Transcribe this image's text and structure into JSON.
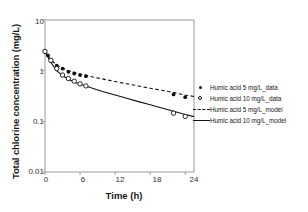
{
  "chart_data": {
    "type": "scatter",
    "title": "",
    "xlabel": "Time (h)",
    "ylabel": "Total chlorine concentration (mg/L)",
    "xlim": [
      0,
      25.5
    ],
    "ylim": [
      0.01,
      10
    ],
    "yscale": "log",
    "xticks": [
      "0",
      "6",
      "12",
      "18",
      "24"
    ],
    "xtick_values": [
      0,
      6,
      12,
      18,
      24
    ],
    "yticks": [
      "10",
      "1",
      "0.1",
      "0.01"
    ],
    "ytick_values": [
      10,
      1,
      0.1,
      0.01
    ],
    "grid": false,
    "legend_position": "right-outside",
    "series": [
      {
        "name": "Humic acid 5 mg/L_data",
        "kind": "scatter",
        "marker": "filled-circle",
        "color": "#111111",
        "x": [
          0,
          0.5,
          1,
          2,
          3,
          4,
          5,
          6,
          7,
          22,
          24
        ],
        "y": [
          2.35,
          2.0,
          1.55,
          1.25,
          1.1,
          0.95,
          0.88,
          0.82,
          0.78,
          0.34,
          0.3
        ]
      },
      {
        "name": "Humic acid 10 mg/L_data",
        "kind": "scatter",
        "marker": "open-circle",
        "color": "#111111",
        "x": [
          0,
          1,
          2,
          3,
          4,
          5,
          6,
          7,
          22,
          24
        ],
        "y": [
          2.4,
          1.6,
          1.1,
          0.82,
          0.7,
          0.62,
          0.55,
          0.5,
          0.145,
          0.125
        ]
      },
      {
        "name": "Humic acid 5 mg/L_model",
        "kind": "line",
        "linestyle": "dashed",
        "color": "#111111",
        "x": [
          0,
          1,
          2,
          3,
          4,
          5,
          6,
          8,
          10,
          12,
          14,
          16,
          18,
          20,
          22,
          24,
          25.5
        ],
        "y": [
          2.4,
          1.62,
          1.3,
          1.12,
          1.0,
          0.92,
          0.86,
          0.76,
          0.68,
          0.61,
          0.55,
          0.5,
          0.45,
          0.41,
          0.37,
          0.33,
          0.31
        ]
      },
      {
        "name": "Humic acid 10 mg/L_model",
        "kind": "line",
        "linestyle": "solid",
        "color": "#111111",
        "x": [
          0,
          1,
          2,
          3,
          4,
          5,
          6,
          7,
          8,
          10,
          12,
          14,
          16,
          18,
          20,
          22,
          24,
          25.5
        ],
        "y": [
          2.4,
          1.45,
          1.0,
          0.8,
          0.68,
          0.6,
          0.54,
          0.5,
          0.455,
          0.385,
          0.33,
          0.285,
          0.245,
          0.212,
          0.183,
          0.158,
          0.137,
          0.124
        ]
      }
    ],
    "legend": [
      {
        "label": "Humic acid 5 mg/L_data",
        "key": "filled-circle"
      },
      {
        "label": "Humic acid 10 mg/L_data",
        "key": "open-circle"
      },
      {
        "label": "Humic acid 5 mg/L_model",
        "key": "dashed-line"
      },
      {
        "label": "Humic acid 10 mg/L_model",
        "key": "solid-line"
      }
    ]
  }
}
